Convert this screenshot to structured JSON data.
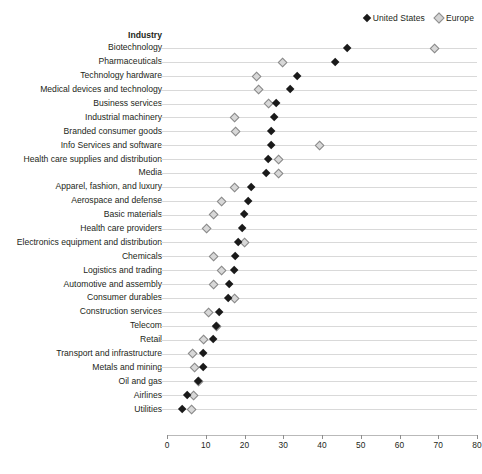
{
  "legend": {
    "entries": [
      {
        "label": "United States",
        "marker": "filled-diamond-icon",
        "color": "#1a1a1a"
      },
      {
        "label": "Europe",
        "marker": "open-diamond-icon",
        "color": "#d8d8d8"
      }
    ]
  },
  "column_header": "Industry",
  "chart_data": {
    "type": "scatter",
    "title": "",
    "subtitle": "",
    "xlabel": "",
    "ylabel": "Industry",
    "xlim": [
      0,
      80
    ],
    "xticks": [
      0,
      10,
      20,
      30,
      40,
      50,
      60,
      70,
      80
    ],
    "xtick_labels": [
      "0",
      "10",
      "20",
      "30",
      "40",
      "50",
      "60",
      "70",
      "80"
    ],
    "grid": "horizontal",
    "legend_position": "top-right",
    "categories": [
      "Biotechnology",
      "Pharmaceuticals",
      "Technology hardware",
      "Medical devices and technology",
      "Business services",
      "Industrial machinery",
      "Branded consumer goods",
      "Info Services and software",
      "Health care supplies and distribution",
      "Media",
      "Apparel, fashion, and luxury",
      "Aerospace and defense",
      "Basic materials",
      "Health care providers",
      "Electronics equipment and distribution",
      "Chemicals",
      "Logistics and trading",
      "Automotive and assembly",
      "Consumer durables",
      "Construction services",
      "Telecom",
      "Retail",
      "Transport and infrastructure",
      "Metals and mining",
      "Oil and gas",
      "Airlines",
      "Utilities"
    ],
    "series": [
      {
        "name": "United States",
        "marker": "filled-diamond",
        "color": "#1a1a1a",
        "values": [
          46.5,
          43.3,
          33.5,
          31.7,
          28.3,
          27.7,
          26.8,
          26.8,
          26.2,
          25.7,
          21.8,
          21.0,
          20.0,
          19.4,
          18.4,
          17.6,
          17.3,
          16.0,
          15.7,
          13.4,
          12.8,
          12.0,
          9.4,
          9.4,
          8.1,
          5.2,
          3.9
        ]
      },
      {
        "name": "Europe",
        "marker": "open-diamond",
        "color": "#d8d8d8",
        "values": [
          69.0,
          29.7,
          23.0,
          23.6,
          26.0,
          17.3,
          17.6,
          39.4,
          28.8,
          28.8,
          17.3,
          13.9,
          12.0,
          10.0,
          20.0,
          12.0,
          13.9,
          11.8,
          17.3,
          10.6,
          12.8,
          9.4,
          6.5,
          7.1,
          8.1,
          6.8,
          6.3
        ]
      }
    ]
  }
}
